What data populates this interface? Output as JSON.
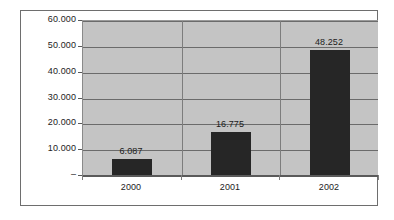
{
  "chart_data": {
    "type": "bar",
    "title": "",
    "subtitle": "",
    "xlabel": "",
    "ylabel": "",
    "categories": [
      "2000",
      "2001",
      "2002"
    ],
    "values": [
      6087,
      16775,
      48252
    ],
    "value_labels": [
      "6.087",
      "16.775",
      "48.252"
    ],
    "series": [
      {
        "name": "",
        "values": [
          6087,
          16775,
          48252
        ],
        "color": "#262626"
      }
    ],
    "ylim": [
      0,
      60000
    ],
    "ytick_values": [
      0,
      10000,
      20000,
      30000,
      40000,
      50000,
      60000
    ],
    "ytick_labels": [
      "–",
      "10.000",
      "20.000",
      "30.000",
      "40.000",
      "50.000",
      "60.000"
    ],
    "grid": true,
    "grid_axis": "y",
    "legend": false,
    "legend_position": "none",
    "number_format": "european-dot-thousands",
    "zero_label_style": "accounting-dash",
    "plot_background": "#c4c4c4",
    "figure_background": "#ffffff",
    "gridline_color": "#6b6b6b",
    "border_color": "#6e6e6e",
    "annotations": []
  }
}
